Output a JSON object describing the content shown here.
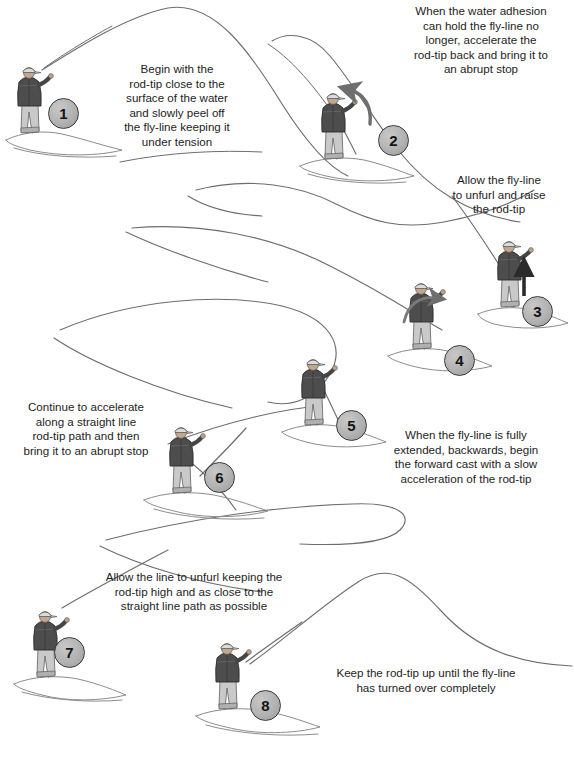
{
  "diagram": {
    "type": "instructional-sequence",
    "palette": {
      "background": "#ffffff",
      "text": "#1d1d1d",
      "fly_line": "#6d6d6d",
      "water_ripple": "#8a8a8a",
      "badge_fill": "#b2b2b2",
      "badge_border": "#3a3a3a",
      "arrow": "#6e6e6e",
      "arrow_dark": "#2b2b2b",
      "jacket": "#4a4a4a",
      "waders": "#c9c9c9",
      "cap": "#d8d8d8"
    },
    "steps": [
      {
        "number": "1",
        "text": "Begin with the\nrod-tip close to the\nsurface of the water\nand slowly peel off\nthe fly-line keeping it\nunder tension",
        "align": "center",
        "arrow": "none"
      },
      {
        "number": "2",
        "text": "When the water adhesion\ncan hold the fly-line no\nlonger, accelerate the\nrod-tip back and bring it to\nan abrupt stop",
        "align": "center",
        "arrow": "curved-up-left"
      },
      {
        "number": "3",
        "text": "Allow the fly-line\nto unfurl and raise\nthe rod-tip",
        "align": "center",
        "arrow": "straight-up"
      },
      {
        "number": "4",
        "text": "",
        "align": "center",
        "arrow": "curved-up-right"
      },
      {
        "number": "5",
        "text": "When the fly-line is fully\nextended, backwards, begin\nthe forward cast with a slow\nacceleration of the rod-tip",
        "align": "justify",
        "arrow": "none"
      },
      {
        "number": "6",
        "text": "Continue to accelerate\nalong a straight line\nrod-tip path and then\nbring it to an abrupt stop",
        "align": "center",
        "arrow": "none"
      },
      {
        "number": "7",
        "text": "Allow the line to unfurl keeping the\nrod-tip high and as close to the\nstraight line path as possible",
        "align": "center",
        "arrow": "none"
      },
      {
        "number": "8",
        "text": "Keep the rod-tip up until the fly-line\nhas turned over completely",
        "align": "center",
        "arrow": "none"
      }
    ]
  }
}
